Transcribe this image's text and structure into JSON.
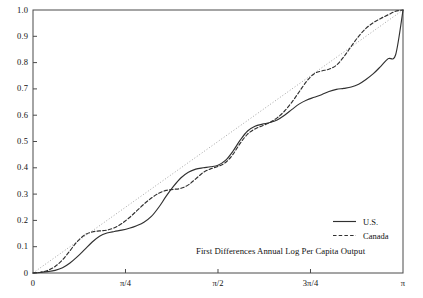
{
  "chart_data": {
    "type": "line",
    "title": "",
    "annotation": "First Differences Annual Log Per Capita Output",
    "xlabel": "",
    "ylabel": "",
    "xlim": [
      0,
      3.14159265
    ],
    "ylim": [
      0,
      1
    ],
    "grid": false,
    "legend_position": "bottom-right",
    "x_tick_values": [
      0,
      0.785398,
      1.570796,
      2.356194,
      3.141593
    ],
    "x_tick_labels": [
      "0",
      "π/4",
      "π/2",
      "3π/4",
      "π"
    ],
    "y_tick_values": [
      0,
      0.1,
      0.2,
      0.3,
      0.4,
      0.5,
      0.6,
      0.7,
      0.8,
      0.9,
      1.0
    ],
    "y_tick_labels": [
      "0",
      "0.1",
      "0.2",
      "0.3",
      "0.4",
      "0.5",
      "0.6",
      "0.7",
      "0.8",
      "0.9",
      "1.0"
    ],
    "series": [
      {
        "name": "U.S.",
        "style": "solid",
        "color": "#303030",
        "x": [
          0.0,
          0.063,
          0.126,
          0.188,
          0.251,
          0.314,
          0.377,
          0.44,
          0.503,
          0.565,
          0.628,
          0.691,
          0.754,
          0.817,
          0.88,
          0.942,
          1.005,
          1.068,
          1.131,
          1.194,
          1.257,
          1.319,
          1.382,
          1.445,
          1.508,
          1.571,
          1.634,
          1.696,
          1.759,
          1.822,
          1.885,
          1.948,
          2.011,
          2.073,
          2.136,
          2.199,
          2.262,
          2.325,
          2.388,
          2.45,
          2.513,
          2.576,
          2.639,
          2.702,
          2.765,
          2.827,
          2.89,
          2.953,
          3.016,
          3.079,
          3.142
        ],
        "y": [
          0.0,
          0.002,
          0.005,
          0.01,
          0.02,
          0.038,
          0.062,
          0.09,
          0.118,
          0.14,
          0.152,
          0.158,
          0.163,
          0.17,
          0.18,
          0.193,
          0.215,
          0.25,
          0.292,
          0.33,
          0.362,
          0.383,
          0.395,
          0.4,
          0.404,
          0.41,
          0.428,
          0.462,
          0.505,
          0.54,
          0.558,
          0.566,
          0.572,
          0.582,
          0.6,
          0.622,
          0.643,
          0.658,
          0.668,
          0.678,
          0.69,
          0.698,
          0.702,
          0.707,
          0.718,
          0.736,
          0.758,
          0.786,
          0.815,
          0.83,
          1.0
        ]
      },
      {
        "name": "Canada",
        "style": "dashed",
        "color": "#303030",
        "x": [
          0.0,
          0.063,
          0.126,
          0.188,
          0.251,
          0.314,
          0.377,
          0.44,
          0.503,
          0.565,
          0.628,
          0.691,
          0.754,
          0.817,
          0.88,
          0.942,
          1.005,
          1.068,
          1.131,
          1.194,
          1.257,
          1.319,
          1.382,
          1.445,
          1.508,
          1.571,
          1.634,
          1.696,
          1.759,
          1.822,
          1.885,
          1.948,
          2.011,
          2.073,
          2.136,
          2.199,
          2.262,
          2.325,
          2.388,
          2.45,
          2.513,
          2.576,
          2.639,
          2.702,
          2.765,
          2.827,
          2.89,
          2.953,
          3.016,
          3.079,
          3.142
        ],
        "y": [
          0.0,
          0.003,
          0.01,
          0.025,
          0.05,
          0.085,
          0.12,
          0.145,
          0.156,
          0.16,
          0.163,
          0.172,
          0.188,
          0.21,
          0.236,
          0.262,
          0.285,
          0.303,
          0.314,
          0.318,
          0.322,
          0.335,
          0.358,
          0.382,
          0.396,
          0.405,
          0.42,
          0.45,
          0.493,
          0.528,
          0.548,
          0.56,
          0.572,
          0.59,
          0.616,
          0.65,
          0.69,
          0.73,
          0.758,
          0.768,
          0.775,
          0.79,
          0.822,
          0.862,
          0.9,
          0.93,
          0.952,
          0.968,
          0.982,
          0.995,
          1.0
        ]
      }
    ],
    "reference_line": {
      "name": "45-degree reference",
      "style": "dotted",
      "color": "#9a9a9a",
      "x": [
        0.0,
        3.141593
      ],
      "y": [
        0.0,
        1.0
      ]
    }
  },
  "legend": {
    "entries": [
      {
        "label": "U.S.",
        "style": "solid"
      },
      {
        "label": "Canada",
        "style": "dashed"
      }
    ]
  }
}
